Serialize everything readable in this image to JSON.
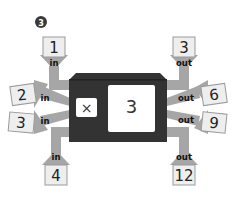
{
  "problem": {
    "number": "3"
  },
  "machine": {
    "operator": "×",
    "operand": "3",
    "body_color": "#333333",
    "pipe_color": "#a6a6a6",
    "card_color": "#eeeeee"
  },
  "inputs": [
    {
      "value": "1",
      "label": "in",
      "position": "top-left"
    },
    {
      "value": "2",
      "label": "in",
      "position": "left-upper"
    },
    {
      "value": "3",
      "label": "in",
      "position": "left-lower"
    },
    {
      "value": "4",
      "label": "in",
      "position": "bottom-left"
    }
  ],
  "outputs": [
    {
      "value": "3",
      "label": "out",
      "position": "top-right"
    },
    {
      "value": "6",
      "label": "out",
      "position": "right-upper"
    },
    {
      "value": "9",
      "label": "out",
      "position": "right-lower"
    },
    {
      "value": "12",
      "label": "out",
      "position": "bottom-right"
    }
  ]
}
